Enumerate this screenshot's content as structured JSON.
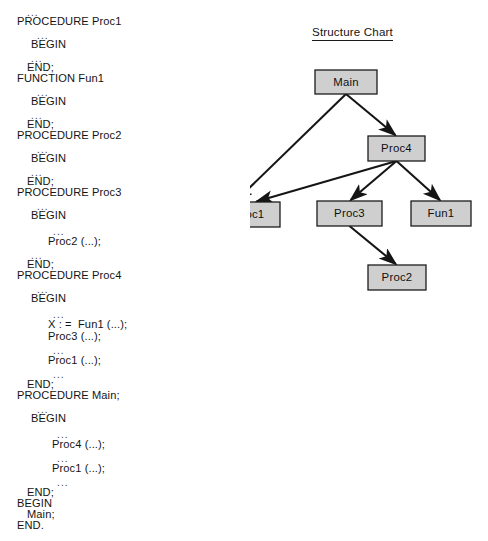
{
  "code_listing": {
    "name": "pseudo-code-listing",
    "lines": [
      {
        "text": "...",
        "indent": 1,
        "x": 27,
        "y": 7,
        "ellipsis": true
      },
      {
        "text": "PROCEDURE Proc1",
        "indent": 0,
        "x": 17,
        "y": 16,
        "ellipsis": false
      },
      {
        "text": "...",
        "indent": 2,
        "x": 37,
        "y": 30,
        "ellipsis": true
      },
      {
        "text": "BEGIN",
        "indent": 1,
        "x": 31,
        "y": 39,
        "ellipsis": false
      },
      {
        "text": "...",
        "indent": 2,
        "x": 31,
        "y": 53,
        "ellipsis": true
      },
      {
        "text": "END;",
        "indent": 1,
        "x": 27,
        "y": 62,
        "ellipsis": false
      },
      {
        "text": "FUNCTION Fun1",
        "indent": 0,
        "x": 17,
        "y": 73,
        "ellipsis": false
      },
      {
        "text": "...",
        "indent": 2,
        "x": 37,
        "y": 87,
        "ellipsis": true
      },
      {
        "text": "BEGIN",
        "indent": 1,
        "x": 31,
        "y": 96,
        "ellipsis": false
      },
      {
        "text": "...",
        "indent": 2,
        "x": 31,
        "y": 110,
        "ellipsis": true
      },
      {
        "text": "END;",
        "indent": 1,
        "x": 27,
        "y": 119,
        "ellipsis": false
      },
      {
        "text": "PROCEDURE Proc2",
        "indent": 0,
        "x": 17,
        "y": 130,
        "ellipsis": false
      },
      {
        "text": "...",
        "indent": 2,
        "x": 37,
        "y": 144,
        "ellipsis": true
      },
      {
        "text": "BEGIN",
        "indent": 1,
        "x": 31,
        "y": 153,
        "ellipsis": false
      },
      {
        "text": "...",
        "indent": 2,
        "x": 31,
        "y": 167,
        "ellipsis": true
      },
      {
        "text": "END;",
        "indent": 1,
        "x": 27,
        "y": 176,
        "ellipsis": false
      },
      {
        "text": "PROCEDURE Proc3",
        "indent": 0,
        "x": 17,
        "y": 187,
        "ellipsis": false
      },
      {
        "text": "...",
        "indent": 2,
        "x": 37,
        "y": 201,
        "ellipsis": true
      },
      {
        "text": "BEGIN",
        "indent": 1,
        "x": 31,
        "y": 210,
        "ellipsis": false
      },
      {
        "text": "...",
        "indent": 3,
        "x": 53,
        "y": 226,
        "ellipsis": true
      },
      {
        "text": "Proc2 (...);",
        "indent": 3,
        "x": 48,
        "y": 236,
        "ellipsis": false
      },
      {
        "text": "...",
        "indent": 2,
        "x": 31,
        "y": 250,
        "ellipsis": true
      },
      {
        "text": "END;",
        "indent": 1,
        "x": 27,
        "y": 259,
        "ellipsis": false
      },
      {
        "text": "PROCEDURE Proc4",
        "indent": 0,
        "x": 17,
        "y": 270,
        "ellipsis": false
      },
      {
        "text": "...",
        "indent": 2,
        "x": 37,
        "y": 284,
        "ellipsis": true
      },
      {
        "text": "BEGIN",
        "indent": 1,
        "x": 31,
        "y": 293,
        "ellipsis": false
      },
      {
        "text": "...",
        "indent": 3,
        "x": 53,
        "y": 309,
        "ellipsis": true
      },
      {
        "text": "X : =  Fun1 (...);",
        "indent": 3,
        "x": 48,
        "y": 319,
        "ellipsis": false
      },
      {
        "text": "Proc3 (...);",
        "indent": 3,
        "x": 48,
        "y": 331,
        "ellipsis": false
      },
      {
        "text": "...",
        "indent": 3,
        "x": 53,
        "y": 345,
        "ellipsis": true
      },
      {
        "text": "Proc1 (...);",
        "indent": 3,
        "x": 48,
        "y": 355,
        "ellipsis": false
      },
      {
        "text": "...",
        "indent": 3,
        "x": 53,
        "y": 369,
        "ellipsis": true
      },
      {
        "text": "END;",
        "indent": 1,
        "x": 27,
        "y": 379,
        "ellipsis": false
      },
      {
        "text": "PROCEDURE Main;",
        "indent": 0,
        "x": 17,
        "y": 390,
        "ellipsis": false
      },
      {
        "text": "...",
        "indent": 2,
        "x": 37,
        "y": 404,
        "ellipsis": true
      },
      {
        "text": "BEGIN",
        "indent": 1,
        "x": 31,
        "y": 413,
        "ellipsis": false
      },
      {
        "text": "...",
        "indent": 3,
        "x": 57,
        "y": 429,
        "ellipsis": true
      },
      {
        "text": "Proc4 (...);",
        "indent": 3,
        "x": 52,
        "y": 439,
        "ellipsis": false
      },
      {
        "text": "...",
        "indent": 3,
        "x": 57,
        "y": 453,
        "ellipsis": true
      },
      {
        "text": "Proc1 (...);",
        "indent": 3,
        "x": 52,
        "y": 463,
        "ellipsis": false
      },
      {
        "text": "...",
        "indent": 3,
        "x": 57,
        "y": 477,
        "ellipsis": true
      },
      {
        "text": "END;",
        "indent": 1,
        "x": 27,
        "y": 487,
        "ellipsis": false
      },
      {
        "text": "BEGIN",
        "indent": 0,
        "x": 17,
        "y": 498,
        "ellipsis": false
      },
      {
        "text": "Main;",
        "indent": 1,
        "x": 27,
        "y": 509,
        "ellipsis": false
      },
      {
        "text": "END.",
        "indent": 0,
        "x": 17,
        "y": 520,
        "ellipsis": false
      }
    ]
  },
  "structure_chart": {
    "title": "Structure Chart",
    "colors": {
      "node_fill": "#cfcfcf",
      "node_stroke": "#1c1c1c",
      "edge": "#151515",
      "background": "#ffffff"
    },
    "nodes": [
      {
        "id": "main",
        "label": "Main",
        "x": 65,
        "y": 70,
        "w": 62,
        "h": 24
      },
      {
        "id": "proc4",
        "label": "Proc4",
        "x": 118,
        "y": 136,
        "w": 57,
        "h": 25
      },
      {
        "id": "proc1",
        "label": "Proc1",
        "x": -32,
        "y": 202,
        "w": 62,
        "h": 25
      },
      {
        "id": "proc3",
        "label": "Proc3",
        "x": 67,
        "y": 201,
        "w": 65,
        "h": 25
      },
      {
        "id": "fun1",
        "label": "Fun1",
        "x": 161,
        "y": 201,
        "w": 60,
        "h": 25
      },
      {
        "id": "proc2",
        "label": "Proc2",
        "x": 118,
        "y": 265,
        "w": 58,
        "h": 25
      }
    ],
    "edges": [
      {
        "from": "main",
        "to": "proc1",
        "label": "Main calls Proc1"
      },
      {
        "from": "main",
        "to": "proc4",
        "label": "Main calls Proc4"
      },
      {
        "from": "proc4",
        "to": "proc1",
        "label": "Proc4 calls Proc1"
      },
      {
        "from": "proc4",
        "to": "proc3",
        "label": "Proc4 calls Proc3"
      },
      {
        "from": "proc4",
        "to": "fun1",
        "label": "Proc4 calls Fun1"
      },
      {
        "from": "proc3",
        "to": "proc2",
        "label": "Proc3 calls Proc2"
      }
    ]
  }
}
